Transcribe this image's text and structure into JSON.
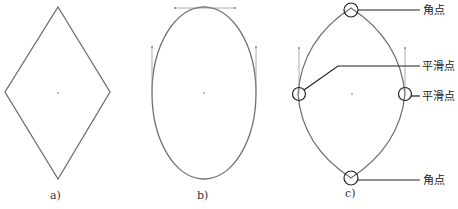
{
  "figure": {
    "panels": [
      {
        "id": "a",
        "label": "a)",
        "shape": "diamond"
      },
      {
        "id": "b",
        "label": "b)",
        "shape": "ellipse"
      },
      {
        "id": "c",
        "label": "c)",
        "shape": "lens"
      }
    ],
    "annotations": {
      "top_corner": "角点",
      "left_smooth": "平滑点",
      "right_smooth": "平滑点",
      "bottom_corner": "角点"
    },
    "colors": {
      "path": "#707070",
      "handle": "#999999",
      "callout": "#222222",
      "center_dot": "#aaaaaa"
    }
  }
}
